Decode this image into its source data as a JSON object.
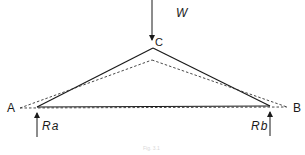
{
  "diagram": {
    "type": "truss-deflection",
    "labels": {
      "load": "W",
      "apex": "C",
      "left_support": "A",
      "right_support": "B",
      "left_reaction": "Ra",
      "right_reaction": "Rb"
    },
    "caption": "Fig. 3.1",
    "colors": {
      "line": "#1a1a1a",
      "background": "#ffffff"
    },
    "geometry": {
      "solid_triangle": [
        [
          37,
          107
        ],
        [
          153,
          48
        ],
        [
          270,
          106
        ]
      ],
      "deflected_triangle_dashed": [
        [
          20,
          108
        ],
        [
          152,
          60
        ],
        [
          287,
          107
        ]
      ],
      "load_arrow": {
        "x": 152,
        "y_from": 0,
        "y_to": 40
      },
      "reaction_arrows": [
        {
          "x": 37,
          "y_from": 137,
          "y_to": 113
        },
        {
          "x": 270,
          "y_from": 136,
          "y_to": 112
        }
      ]
    }
  }
}
